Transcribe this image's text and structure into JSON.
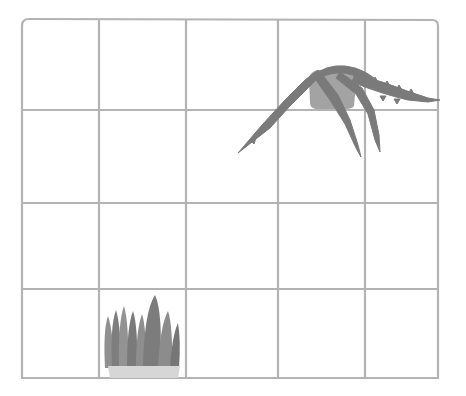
{
  "board": {
    "rows": 4,
    "cols": 5,
    "line_color": "#b3b3b3",
    "background": "#ffffff",
    "x_lines": [
      22,
      99,
      186,
      278,
      365,
      438
    ],
    "y_lines": [
      20,
      110,
      203,
      289,
      378
    ]
  },
  "plants": [
    {
      "type": "fern",
      "icon": "hanging-fern-icon",
      "cell": {
        "row": 0,
        "col": 3
      },
      "color": "#7a7a7a"
    },
    {
      "type": "grass",
      "icon": "grass-tuft-icon",
      "cell": {
        "row": 3,
        "col": 1
      },
      "color": "#8a8a8a",
      "pot_color": "#d6d6d6"
    }
  ]
}
